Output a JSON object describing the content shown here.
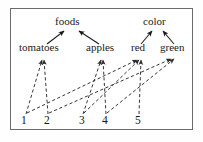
{
  "diagram": {
    "frame": {
      "stroke": "#6b6b6b"
    },
    "edge_colors": {
      "solid": "#1a1a1a",
      "dashed": "#2b2b2b"
    },
    "categories": [
      {
        "id": "foods",
        "label": "foods",
        "x": 70,
        "y": 26
      },
      {
        "id": "color",
        "label": "color",
        "x": 157,
        "y": 26
      }
    ],
    "concepts": [
      {
        "id": "tomatoes",
        "label": "tomatoes",
        "x": 44,
        "y": 52
      },
      {
        "id": "apples",
        "label": "apples",
        "x": 103,
        "y": 52
      },
      {
        "id": "red",
        "label": "red",
        "x": 140,
        "y": 52
      },
      {
        "id": "green",
        "label": "green",
        "x": 173,
        "y": 52
      }
    ],
    "instances": [
      {
        "id": "n1",
        "label": "1",
        "x": 24,
        "y": 122
      },
      {
        "id": "n2",
        "label": "2",
        "x": 47,
        "y": 122
      },
      {
        "id": "n3",
        "label": "3",
        "x": 82,
        "y": 122
      },
      {
        "id": "n4",
        "label": "4",
        "x": 105,
        "y": 122
      },
      {
        "id": "n5",
        "label": "5",
        "x": 138,
        "y": 122
      }
    ],
    "isa_edges": [
      {
        "from": "tomatoes",
        "to": "foods",
        "style": "solid"
      },
      {
        "from": "apples",
        "to": "foods",
        "style": "solid"
      },
      {
        "from": "red",
        "to": "color",
        "style": "solid"
      },
      {
        "from": "green",
        "to": "color",
        "style": "solid"
      }
    ],
    "instance_edges": [
      {
        "from": "n1",
        "to": "tomatoes",
        "style": "dashed"
      },
      {
        "from": "n1",
        "to": "red",
        "style": "dashed"
      },
      {
        "from": "n2",
        "to": "tomatoes",
        "style": "dashed"
      },
      {
        "from": "n2",
        "to": "green",
        "style": "dashed"
      },
      {
        "from": "n3",
        "to": "apples",
        "style": "dashed"
      },
      {
        "from": "n3",
        "to": "red",
        "style": "dashed"
      },
      {
        "from": "n4",
        "to": "apples",
        "style": "dashed"
      },
      {
        "from": "n4",
        "to": "green",
        "style": "dashed"
      },
      {
        "from": "n5",
        "to": "red",
        "style": "dashed"
      }
    ]
  }
}
